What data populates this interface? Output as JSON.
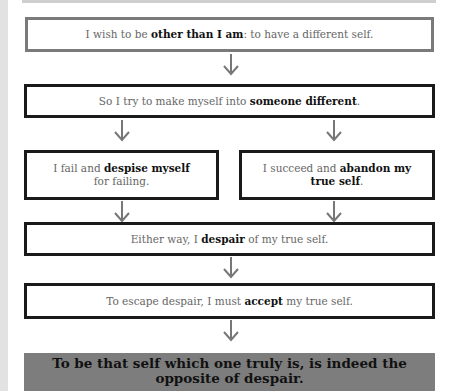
{
  "diagram": {
    "boxes": [
      {
        "pre": "I wish to be ",
        "bold": "other than I am",
        "post": ": to have a different self."
      },
      {
        "pre": "So I try to make myself into ",
        "bold": "someone different",
        "post": "."
      },
      {
        "pre": "I fail and ",
        "bold": "despise myself",
        "post": "for failing."
      },
      {
        "pre": "I succeed and ",
        "bold": "abandon my true self",
        "post": "."
      },
      {
        "pre": "Either way, I ",
        "bold": "despair",
        "post": " of my true self."
      },
      {
        "pre": "To escape despair, I must ",
        "bold": "accept",
        "post": " my true self."
      }
    ],
    "conclusion": {
      "line1": "To be that self which one truly is, is indeed the",
      "line2": "opposite of despair."
    },
    "colors": {
      "final_bg": "#7d7d7d",
      "gray_border": "#7a7a7a",
      "black_border": "#1a1a1a"
    }
  }
}
